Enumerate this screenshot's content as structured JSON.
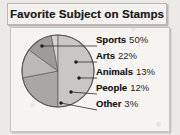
{
  "title": "Favorite Subject on Stamps",
  "chart_data": {
    "type": "pie",
    "title": "Favorite Subject on Stamps",
    "xlabel": "",
    "ylabel": "",
    "legend_position": "right",
    "grid": false,
    "categories": [
      "Sports",
      "Arts",
      "Animals",
      "People",
      "Other"
    ],
    "values": [
      50,
      22,
      13,
      12,
      3
    ],
    "value_unit": "%",
    "labels": [
      "Sports 50%",
      "Arts 22%",
      "Animals 13%",
      "People 12%",
      "Other 3%"
    ],
    "slice_colors": [
      "#c9c7c2",
      "#a9a7a2",
      "#bcbab5",
      "#9e9c97",
      "#d6d4cf"
    ],
    "slices": [
      {
        "name": "Sports",
        "value": 50,
        "display_value": "50%",
        "label": "Sports 50%",
        "color": "#c9c7c2"
      },
      {
        "name": "Arts",
        "value": 22,
        "display_value": "22%",
        "label": "Arts 22%",
        "color": "#a9a7a2"
      },
      {
        "name": "Animals",
        "value": 13,
        "display_value": "13%",
        "label": "Animals 13%",
        "color": "#bcbab5"
      },
      {
        "name": "People",
        "value": 12,
        "display_value": "12%",
        "label": "People 12%",
        "color": "#9e9c97"
      },
      {
        "name": "Other",
        "value": 3,
        "display_value": "3%",
        "label": "Other 3%",
        "color": "#d6d4cf"
      }
    ]
  },
  "legend": {
    "rows": [
      {
        "name": "Sports",
        "value": "50%"
      },
      {
        "name": "Arts",
        "value": "22%"
      },
      {
        "name": "Animals",
        "value": "13%"
      },
      {
        "name": "People",
        "value": "12%"
      },
      {
        "name": "Other",
        "value": "3%"
      }
    ]
  },
  "colors": {
    "page_background": "#eceae6",
    "plate_background": "#f5f4f1",
    "title_background": "#f3f2ef",
    "border": "#c6c4bf",
    "outline": "#5d5b57",
    "text": "#131313"
  }
}
